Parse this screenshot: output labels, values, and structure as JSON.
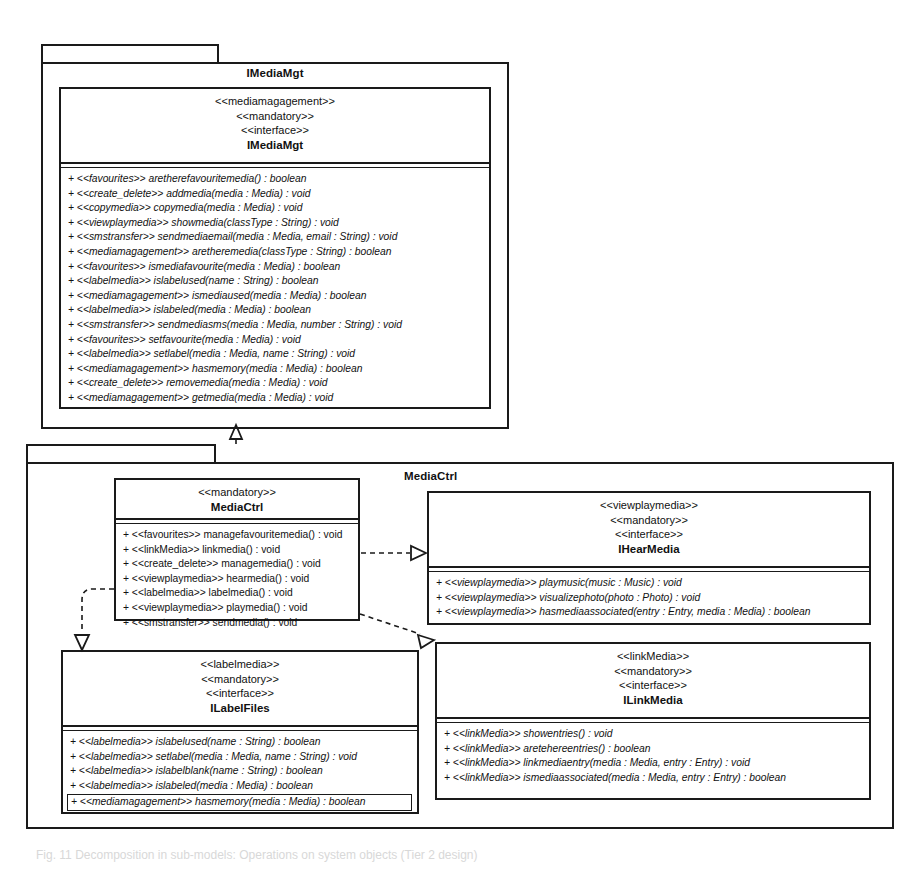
{
  "diagram": {
    "type": "uml-class-diagram",
    "caption": "Fig. 11 Decomposition in sub-models: Operations on system objects (Tier 2 design)"
  },
  "packages": [
    {
      "id": "pkg-imediamgt",
      "name": "IMediaMgt"
    },
    {
      "id": "pkg-mediactrl",
      "name": "MediaCtrl"
    }
  ],
  "classifiers": {
    "imediamgt": {
      "name": "IMediaMgt",
      "stereotypes": [
        "<<mediamagagement>>",
        "<<mandatory>>",
        "<<interface>>"
      ],
      "operations": [
        "+ <<favourites>> aretherefavouritemedia() : boolean",
        "+ <<create_delete>> addmedia(media : Media) : void",
        "+ <<copymedia>> copymedia(media : Media) : void",
        "+ <<viewplaymedia>> showmedia(classType : String) : void",
        "+ <<smstransfer>> sendmediaemail(media : Media, email : String) : void",
        "+ <<mediamagagement>> aretheremedia(classType : String) : boolean",
        "+ <<favourites>> ismediafavourite(media : Media) : boolean",
        "+ <<labelmedia>> islabelused(name : String) : boolean",
        "+ <<mediamagagement>> ismediaused(media : Media) : boolean",
        "+ <<labelmedia>> islabeled(media : Media) : boolean",
        "+ <<smstransfer>> sendmediasms(media : Media, number : String) : void",
        "+ <<favourites>> setfavourite(media : Media) : void",
        "+ <<labelmedia>> setlabel(media : Media, name : String) : void",
        "+ <<mediamagagement>> hasmemory(media : Media) : boolean",
        "+ <<create_delete>> removemedia(media : Media) : void",
        "+ <<mediamagagement>> getmedia(media : Media) : void"
      ]
    },
    "mediactrl": {
      "name": "MediaCtrl",
      "stereotypes": [
        "<<mandatory>>"
      ],
      "operations": [
        "+ <<favourites>> managefavouritemedia() : void",
        "+ <<linkMedia>> linkmedia() : void",
        "+ <<create_delete>> managemedia() : void",
        "+ <<viewplaymedia>> hearmedia() : void",
        "+ <<labelmedia>> labelmedia() : void",
        "+ <<viewplaymedia>> playmedia() : void",
        "+ <<smstransfer>> sendmedia() : void"
      ]
    },
    "ihearmedia": {
      "name": "IHearMedia",
      "stereotypes": [
        "<<viewplaymedia>>",
        "<<mandatory>>",
        "<<interface>>"
      ],
      "operations": [
        "+ <<viewplaymedia>> playmusic(music : Music) : void",
        "+ <<viewplaymedia>> visualizephoto(photo : Photo) : void",
        "+ <<viewplaymedia>> hasmediaassociated(entry : Entry, media : Media) : boolean"
      ]
    },
    "ilabelfiles": {
      "name": "ILabelFiles",
      "stereotypes": [
        "<<labelmedia>>",
        "<<mandatory>>",
        "<<interface>>"
      ],
      "operations": [
        "+ <<labelmedia>> islabelused(name : String) : boolean",
        "+ <<labelmedia>> setlabel(media : Media, name : String) : void",
        "+ <<labelmedia>> islabelblank(name : String) : boolean",
        "+ <<labelmedia>> islabeled(media : Media) : boolean",
        "+ <<mediamagagement>> hasmemory(media : Media) : boolean"
      ],
      "highlighted_operation_index": 4
    },
    "ilinkmedia": {
      "name": "ILinkMedia",
      "stereotypes": [
        "<<linkMedia>>",
        "<<mandatory>>",
        "<<interface>>"
      ],
      "operations": [
        "+ <<linkMedia>> showentries() : void",
        "+ <<linkMedia>> aretehereentries() : boolean",
        "+ <<linkMedia>> linkmediaentry(media : Media, entry : Entry) : void",
        "+ <<linkMedia>> ismediaassociated(media : Media, entry : Entry) : boolean"
      ]
    }
  },
  "relationships": [
    {
      "from": "pkg-mediactrl",
      "to": "pkg-imediamgt",
      "kind": "dependency-realization",
      "style": "dashed",
      "arrow": "hollow-triangle"
    },
    {
      "from": "mediactrl",
      "to": "ihearmedia",
      "kind": "realization",
      "style": "dashed",
      "arrow": "hollow-triangle"
    },
    {
      "from": "mediactrl",
      "to": "ilinkmedia",
      "kind": "realization",
      "style": "dashed",
      "arrow": "hollow-triangle"
    },
    {
      "from": "mediactrl",
      "to": "ilabelfiles",
      "kind": "realization",
      "style": "dashed",
      "arrow": "hollow-triangle"
    }
  ],
  "colors": {
    "line": "#1a1a1a",
    "background": "#ffffff",
    "caption": "#d8d8d8"
  }
}
